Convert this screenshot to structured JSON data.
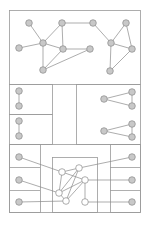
{
  "diagram": {
    "type": "graph-layout",
    "colors": {
      "frame": "#9a9a9a",
      "edge": "#8a8a8a",
      "node_fill": "#c8c8c8",
      "node_stroke": "#8a8a8a",
      "open_node_fill": "#ffffff"
    },
    "panels": [
      {
        "id": "top",
        "x": 9,
        "y": 10,
        "w": 131,
        "h": 74
      },
      {
        "id": "left-upper",
        "x": 9,
        "y": 84,
        "w": 43,
        "h": 30
      },
      {
        "id": "left-lower",
        "x": 9,
        "y": 114,
        "w": 43,
        "h": 30
      },
      {
        "id": "right",
        "x": 76,
        "y": 84,
        "w": 64,
        "h": 60
      },
      {
        "id": "bottom-outer",
        "x": 9,
        "y": 144,
        "w": 131,
        "h": 68
      },
      {
        "id": "bottom-left-col",
        "x": 9,
        "y": 144,
        "w": 31,
        "h": 68
      },
      {
        "id": "bottom-right-col",
        "x": 110,
        "y": 144,
        "w": 30,
        "h": 68
      },
      {
        "id": "bottom-center",
        "x": 52,
        "y": 157,
        "w": 45,
        "h": 55
      }
    ],
    "dividers": [
      [
        9,
        167,
        40,
        167
      ],
      [
        9,
        190,
        40,
        190
      ],
      [
        110,
        167,
        140,
        167
      ],
      [
        110,
        190,
        140,
        190
      ]
    ],
    "nodes": [
      {
        "id": "t1",
        "x": 29,
        "y": 23
      },
      {
        "id": "t2",
        "x": 62,
        "y": 23
      },
      {
        "id": "t3",
        "x": 93,
        "y": 23
      },
      {
        "id": "t4",
        "x": 126,
        "y": 23
      },
      {
        "id": "t5",
        "x": 19,
        "y": 48
      },
      {
        "id": "t6",
        "x": 43,
        "y": 43
      },
      {
        "id": "t7",
        "x": 63,
        "y": 49
      },
      {
        "id": "t8",
        "x": 90,
        "y": 49
      },
      {
        "id": "t9",
        "x": 111,
        "y": 43
      },
      {
        "id": "t10",
        "x": 132,
        "y": 49
      },
      {
        "id": "t11",
        "x": 43,
        "y": 70
      },
      {
        "id": "t12",
        "x": 110,
        "y": 71
      },
      {
        "id": "l1",
        "x": 19,
        "y": 91
      },
      {
        "id": "l2",
        "x": 19,
        "y": 106
      },
      {
        "id": "l3",
        "x": 19,
        "y": 121
      },
      {
        "id": "l4",
        "x": 19,
        "y": 136
      },
      {
        "id": "r1",
        "x": 104,
        "y": 99
      },
      {
        "id": "r2",
        "x": 132,
        "y": 92
      },
      {
        "id": "r3",
        "x": 132,
        "y": 106
      },
      {
        "id": "r4",
        "x": 104,
        "y": 131
      },
      {
        "id": "r5",
        "x": 132,
        "y": 124
      },
      {
        "id": "r6",
        "x": 132,
        "y": 137
      },
      {
        "id": "bl1",
        "x": 19,
        "y": 157
      },
      {
        "id": "bl2",
        "x": 19,
        "y": 180
      },
      {
        "id": "bl3",
        "x": 19,
        "y": 202
      },
      {
        "id": "br1",
        "x": 132,
        "y": 157
      },
      {
        "id": "br2",
        "x": 132,
        "y": 180
      },
      {
        "id": "br3",
        "x": 132,
        "y": 202
      }
    ],
    "open_nodes": [
      {
        "id": "c1",
        "x": 62,
        "y": 172
      },
      {
        "id": "c2",
        "x": 79,
        "y": 168
      },
      {
        "id": "c3",
        "x": 85,
        "y": 180
      },
      {
        "id": "c4",
        "x": 59,
        "y": 193
      },
      {
        "id": "c5",
        "x": 66,
        "y": 201
      },
      {
        "id": "c6",
        "x": 85,
        "y": 202
      }
    ],
    "edges": [
      [
        "t1",
        "t6"
      ],
      [
        "t5",
        "t6"
      ],
      [
        "t6",
        "t2"
      ],
      [
        "t6",
        "t7"
      ],
      [
        "t6",
        "t11"
      ],
      [
        "t2",
        "t7"
      ],
      [
        "t2",
        "t3"
      ],
      [
        "t7",
        "t11"
      ],
      [
        "t11",
        "t8"
      ],
      [
        "t7",
        "t8"
      ],
      [
        "t3",
        "t9"
      ],
      [
        "t9",
        "t4"
      ],
      [
        "t9",
        "t10"
      ],
      [
        "t4",
        "t10"
      ],
      [
        "t9",
        "t12"
      ],
      [
        "t12",
        "t10"
      ],
      [
        "l1",
        "l2"
      ],
      [
        "l3",
        "l4"
      ],
      [
        "r1",
        "r2"
      ],
      [
        "r1",
        "r3"
      ],
      [
        "r2",
        "r3"
      ],
      [
        "r4",
        "r5"
      ],
      [
        "r4",
        "r6"
      ],
      [
        "r5",
        "r6"
      ],
      [
        "bl1",
        "c1"
      ],
      [
        "bl2",
        "c4"
      ],
      [
        "bl3",
        "c5"
      ],
      [
        "br1",
        "c2"
      ],
      [
        "br2",
        "c3"
      ],
      [
        "br3",
        "c6"
      ],
      [
        "c1",
        "c2"
      ],
      [
        "c1",
        "c3"
      ],
      [
        "c1",
        "c4"
      ],
      [
        "c2",
        "c4"
      ],
      [
        "c3",
        "c4"
      ],
      [
        "c3",
        "c5"
      ],
      [
        "c4",
        "c5"
      ],
      [
        "c3",
        "c6"
      ],
      [
        "c2",
        "c5"
      ]
    ]
  }
}
